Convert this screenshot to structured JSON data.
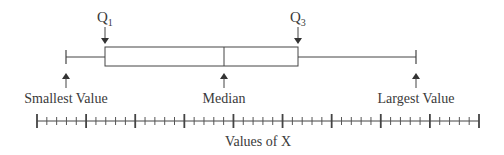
{
  "diagram": {
    "labels": {
      "q1": "Q",
      "q1_sub": "1",
      "q3": "Q",
      "q3_sub": "3",
      "smallest": "Smallest Value",
      "median": "Median",
      "largest": "Largest Value",
      "axis": "Values of X"
    },
    "colors": {
      "stroke": "#444444",
      "text": "#3a3a3a",
      "background": "#ffffff"
    }
  },
  "chart_data": {
    "type": "boxplot",
    "title": "",
    "xlabel": "Values of X",
    "ylabel": "",
    "axis": {
      "major_ticks": 10,
      "minor_divisions_per_interval": 5,
      "tick_labels": []
    },
    "box": {
      "min_label": "Smallest Value",
      "q1_label": "Q1",
      "median_label": "Median",
      "q3_label": "Q3",
      "max_label": "Largest Value",
      "approx_positions_in_major_units": {
        "min": 0.6,
        "q1": 1.4,
        "median": 3.8,
        "q3": 5.3,
        "max": 7.7
      }
    }
  }
}
